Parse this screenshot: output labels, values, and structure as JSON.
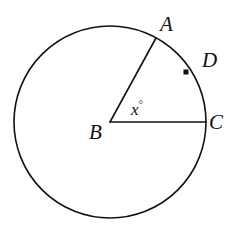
{
  "figure": {
    "type": "circle-with-central-angle",
    "background_color": "#ffffff",
    "stroke_color": "#111111",
    "stroke_width": 1.6
  },
  "circle": {
    "name": "circle-B",
    "center_x": 110,
    "center_y": 122,
    "radius": 96
  },
  "points": [
    {
      "id": "A",
      "label": "A",
      "on_circle": true,
      "x": 156,
      "y": 38,
      "label_x": 160,
      "label_y": 14
    },
    {
      "id": "B",
      "label": "B",
      "on_circle": false,
      "is_center": true,
      "x": 110,
      "y": 122,
      "label_x": 89,
      "label_y": 122
    },
    {
      "id": "C",
      "label": "C",
      "on_circle": true,
      "x": 206,
      "y": 122,
      "label_x": 209,
      "label_y": 112
    },
    {
      "id": "D",
      "label": "D",
      "on_circle": true,
      "marker": "filled-square-dot",
      "marker_size": 5,
      "x": 186,
      "y": 72,
      "label_x": 202,
      "label_y": 50
    }
  ],
  "segments": [
    {
      "id": "BA",
      "from": "B",
      "to": "A",
      "kind": "radius"
    },
    {
      "id": "BC",
      "from": "B",
      "to": "C",
      "kind": "radius"
    }
  ],
  "angle": {
    "vertex": "B",
    "rays": [
      "A",
      "C"
    ],
    "label_text": "x",
    "degree_symbol": "°",
    "label_x": 131,
    "label_y": 101
  }
}
